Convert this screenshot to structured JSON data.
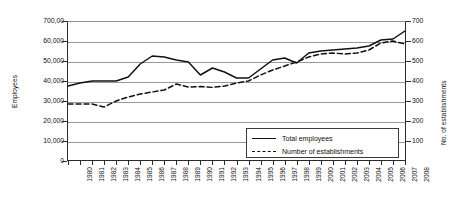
{
  "chart_data": {
    "type": "line",
    "title": "",
    "xlabel": "",
    "ylabel": "Employees",
    "y2label": "No. of establishments",
    "grid": true,
    "legend_position": "inside-bottom-right",
    "x": [
      1980,
      1981,
      1982,
      1983,
      1984,
      1985,
      1986,
      1987,
      1988,
      1989,
      1990,
      1991,
      1992,
      1993,
      1994,
      1995,
      1996,
      1997,
      1998,
      1999,
      2000,
      2001,
      2002,
      2003,
      2004,
      2005,
      2006,
      2007,
      2008
    ],
    "xticklabels": [
      "1980",
      "1981",
      "1982",
      "1983",
      "1984",
      "1985",
      "1986",
      "1987",
      "1988",
      "1989",
      "1990",
      "1991",
      "1992",
      "1993",
      "1994",
      "1995",
      "1996",
      "1997",
      "1998",
      "1999",
      "2000",
      "2001",
      "2002",
      "2003",
      "2004",
      "2005",
      "2006",
      "2007",
      "2008"
    ],
    "ylim": [
      0,
      70000
    ],
    "yticks": [
      0,
      10000,
      20000,
      30000,
      40000,
      50000,
      60000,
      70000
    ],
    "yticklabels": [
      "0",
      "10,000",
      "20,000",
      "30,000",
      "40,000",
      "50,000",
      "60,000",
      "700,00"
    ],
    "y2lim": [
      0,
      700
    ],
    "y2ticks": [
      100,
      200,
      300,
      400,
      500,
      600,
      700
    ],
    "y2ticklabels": [
      "100",
      "200",
      "300",
      "400",
      "500",
      "600",
      "700"
    ],
    "series": [
      {
        "name": "Total employees",
        "axis": "left",
        "style": "solid",
        "color": "#111111",
        "values": [
          37500,
          39000,
          40000,
          40000,
          40000,
          42000,
          48500,
          52500,
          52000,
          50500,
          49500,
          43000,
          46500,
          44500,
          41500,
          41500,
          46000,
          50500,
          51500,
          49000,
          54000,
          55000,
          55500,
          56000,
          56500,
          57500,
          60500,
          61000,
          65000
        ]
      },
      {
        "name": "Number of establishments",
        "axis": "right",
        "style": "dashed",
        "color": "#111111",
        "values": [
          285,
          285,
          285,
          270,
          300,
          320,
          335,
          345,
          355,
          385,
          370,
          372,
          368,
          375,
          390,
          400,
          430,
          455,
          475,
          495,
          520,
          535,
          540,
          535,
          540,
          555,
          590,
          600,
          585
        ]
      }
    ]
  },
  "legend": {
    "entries": [
      {
        "label": "Total employees",
        "style": "solid"
      },
      {
        "label": "Number of establishments",
        "style": "dashed"
      }
    ]
  }
}
